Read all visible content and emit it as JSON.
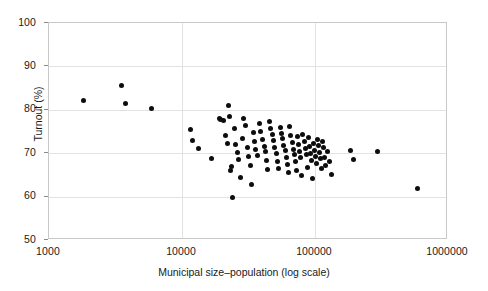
{
  "chart_data": {
    "type": "scatter",
    "title": "",
    "xlabel": "Municipal size–population (log scale)",
    "ylabel": "Turnout (%)",
    "xscale": "log",
    "xlim": [
      1000,
      1000000
    ],
    "ylim": [
      50,
      100
    ],
    "xticks": [
      1000,
      10000,
      100000,
      1000000
    ],
    "xtick_labels": [
      "1000",
      "10000",
      "100000",
      "1000000"
    ],
    "yticks": [
      50,
      60,
      70,
      80,
      90,
      100
    ],
    "ytick_labels": [
      "50",
      "60",
      "70",
      "80",
      "90",
      "100"
    ],
    "grid": true,
    "legend": null,
    "marker": {
      "shape": "circle",
      "color": "#0d0d0d",
      "size": 5
    },
    "points": [
      {
        "x": 1820,
        "y": 82.2
      },
      {
        "x": 3480,
        "y": 85.7
      },
      {
        "x": 3790,
        "y": 81.4
      },
      {
        "x": 5900,
        "y": 80.3
      },
      {
        "x": 11600,
        "y": 75.5
      },
      {
        "x": 11900,
        "y": 73.0
      },
      {
        "x": 13200,
        "y": 71.0
      },
      {
        "x": 16600,
        "y": 68.8
      },
      {
        "x": 19100,
        "y": 77.9
      },
      {
        "x": 19600,
        "y": 77.7
      },
      {
        "x": 20400,
        "y": 77.6
      },
      {
        "x": 21200,
        "y": 74.0
      },
      {
        "x": 21900,
        "y": 72.3
      },
      {
        "x": 22400,
        "y": 81.1
      },
      {
        "x": 22800,
        "y": 78.4
      },
      {
        "x": 23100,
        "y": 65.9
      },
      {
        "x": 23600,
        "y": 66.9
      },
      {
        "x": 24000,
        "y": 59.7
      },
      {
        "x": 24800,
        "y": 75.6
      },
      {
        "x": 25400,
        "y": 71.9
      },
      {
        "x": 26100,
        "y": 70.1
      },
      {
        "x": 26800,
        "y": 68.6
      },
      {
        "x": 27500,
        "y": 64.4
      },
      {
        "x": 28400,
        "y": 73.4
      },
      {
        "x": 29200,
        "y": 78.1
      },
      {
        "x": 30100,
        "y": 76.3
      },
      {
        "x": 31000,
        "y": 71.4
      },
      {
        "x": 31800,
        "y": 69.2
      },
      {
        "x": 32600,
        "y": 67.1
      },
      {
        "x": 33500,
        "y": 62.8
      },
      {
        "x": 34300,
        "y": 74.8
      },
      {
        "x": 35200,
        "y": 72.6
      },
      {
        "x": 36000,
        "y": 70.8
      },
      {
        "x": 37000,
        "y": 69.4
      },
      {
        "x": 38100,
        "y": 76.8
      },
      {
        "x": 39200,
        "y": 75.1
      },
      {
        "x": 40300,
        "y": 73.1
      },
      {
        "x": 41400,
        "y": 71.6
      },
      {
        "x": 42500,
        "y": 70.3
      },
      {
        "x": 43100,
        "y": 68.3
      },
      {
        "x": 44200,
        "y": 66.2
      },
      {
        "x": 45300,
        "y": 77.2
      },
      {
        "x": 46500,
        "y": 75.7
      },
      {
        "x": 47600,
        "y": 74.2
      },
      {
        "x": 48800,
        "y": 72.9
      },
      {
        "x": 49900,
        "y": 71.2
      },
      {
        "x": 51000,
        "y": 69.9
      },
      {
        "x": 52200,
        "y": 68.1
      },
      {
        "x": 53500,
        "y": 66.5
      },
      {
        "x": 54700,
        "y": 75.9
      },
      {
        "x": 55900,
        "y": 74.6
      },
      {
        "x": 57100,
        "y": 73.3
      },
      {
        "x": 58300,
        "y": 71.8
      },
      {
        "x": 59600,
        "y": 70.6
      },
      {
        "x": 60800,
        "y": 69.1
      },
      {
        "x": 62000,
        "y": 67.4
      },
      {
        "x": 63300,
        "y": 65.5
      },
      {
        "x": 64600,
        "y": 76.1
      },
      {
        "x": 65900,
        "y": 74.1
      },
      {
        "x": 67200,
        "y": 72.4
      },
      {
        "x": 68500,
        "y": 70.9
      },
      {
        "x": 69900,
        "y": 69.6
      },
      {
        "x": 71200,
        "y": 68.0
      },
      {
        "x": 72600,
        "y": 66.1
      },
      {
        "x": 74000,
        "y": 73.8
      },
      {
        "x": 75400,
        "y": 72.0
      },
      {
        "x": 76800,
        "y": 70.4
      },
      {
        "x": 78300,
        "y": 68.9
      },
      {
        "x": 79700,
        "y": 64.9
      },
      {
        "x": 81200,
        "y": 74.4
      },
      {
        "x": 82700,
        "y": 72.7
      },
      {
        "x": 84200,
        "y": 71.1
      },
      {
        "x": 85800,
        "y": 69.7
      },
      {
        "x": 87300,
        "y": 66.8
      },
      {
        "x": 88900,
        "y": 73.6
      },
      {
        "x": 90500,
        "y": 71.5
      },
      {
        "x": 92100,
        "y": 70.0
      },
      {
        "x": 93800,
        "y": 68.4
      },
      {
        "x": 95400,
        "y": 64.1
      },
      {
        "x": 97100,
        "y": 72.2
      },
      {
        "x": 98800,
        "y": 70.7
      },
      {
        "x": 100600,
        "y": 69.3
      },
      {
        "x": 102400,
        "y": 67.6
      },
      {
        "x": 104200,
        "y": 73.2
      },
      {
        "x": 106000,
        "y": 71.7
      },
      {
        "x": 107900,
        "y": 70.2
      },
      {
        "x": 109800,
        "y": 68.7
      },
      {
        "x": 111700,
        "y": 66.4
      },
      {
        "x": 113700,
        "y": 72.8
      },
      {
        "x": 115600,
        "y": 71.3
      },
      {
        "x": 117700,
        "y": 69.0
      },
      {
        "x": 119700,
        "y": 67.2
      },
      {
        "x": 124000,
        "y": 70.5
      },
      {
        "x": 128000,
        "y": 68.2
      },
      {
        "x": 133000,
        "y": 65.2
      },
      {
        "x": 185000,
        "y": 70.6
      },
      {
        "x": 196000,
        "y": 68.5
      },
      {
        "x": 297000,
        "y": 70.4
      },
      {
        "x": 588000,
        "y": 61.8
      }
    ]
  },
  "axes": {
    "y_tick_labels": [
      "100",
      "90",
      "80",
      "70",
      "60",
      "50"
    ],
    "x_tick_labels": [
      "1000",
      "10000",
      "100000",
      "1000000"
    ],
    "x_axis_title": "Municipal size–population (log scale)",
    "y_axis_title": "Turnout (%)"
  }
}
